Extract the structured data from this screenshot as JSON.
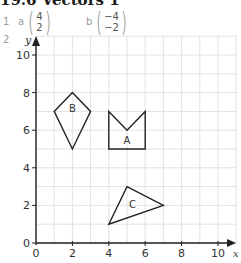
{
  "title": "19.6 Vectors 1",
  "questions": [
    {
      "number": "1",
      "parts": [
        {
          "label": "a",
          "vector": [
            "4",
            "2"
          ]
        },
        {
          "label": "b",
          "vector": [
            "−4",
            "−2"
          ]
        }
      ]
    },
    {
      "number": "2"
    }
  ],
  "graph": {
    "x_label": "x",
    "y_label": "y",
    "x_ticks": [
      "0",
      "2",
      "4",
      "6",
      "8",
      "10"
    ],
    "y_ticks": [
      "0",
      "2",
      "4",
      "6",
      "8",
      "10"
    ],
    "shapes": [
      {
        "label": "A",
        "points": [
          [
            4,
            5
          ],
          [
            4,
            7
          ],
          [
            5,
            6
          ],
          [
            6,
            7
          ],
          [
            6,
            5
          ]
        ]
      },
      {
        "label": "B",
        "points": [
          [
            1,
            7
          ],
          [
            2,
            8
          ],
          [
            3,
            7
          ],
          [
            2,
            5
          ]
        ]
      },
      {
        "label": "C",
        "points": [
          [
            4,
            1
          ],
          [
            5,
            3
          ],
          [
            7,
            2
          ]
        ]
      }
    ]
  }
}
